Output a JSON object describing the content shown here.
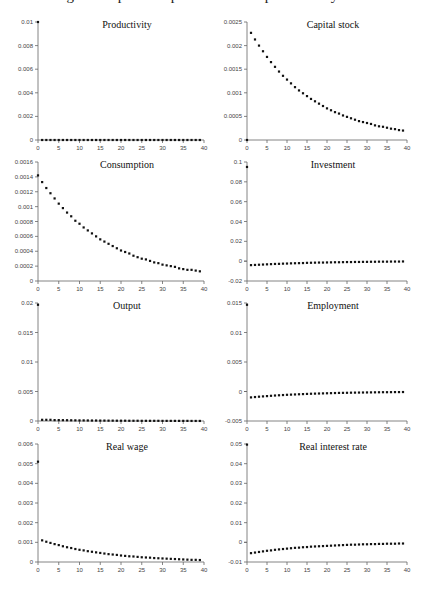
{
  "figure": {
    "title": "Figure: Impulse responses to a 1% productivity shock"
  },
  "chart_data": [
    {
      "type": "scatter",
      "title": "Productivity",
      "xlabel": "",
      "ylabel": "",
      "xlim": [
        0,
        40
      ],
      "ylim": [
        0,
        0.01
      ],
      "xticks": [
        "0",
        "5",
        "10",
        "15",
        "20",
        "25",
        "30",
        "35",
        "40"
      ],
      "yticks": [
        0,
        0.002,
        0.004,
        0.006,
        0.008,
        0.01
      ],
      "ytick_labels": [
        "0",
        "0.002",
        "0.004",
        "0.006",
        "0.008",
        "0.01"
      ],
      "grid": false,
      "x": [
        0,
        1,
        2,
        3,
        4,
        5,
        6,
        7,
        8,
        9,
        10,
        11,
        12,
        13,
        14,
        15,
        16,
        17,
        18,
        19,
        20,
        21,
        22,
        23,
        24,
        25,
        26,
        27,
        28,
        29,
        30,
        31,
        32,
        33,
        34,
        35,
        36,
        37,
        38,
        39
      ],
      "y": [
        0.01,
        0,
        0,
        0,
        0,
        0,
        0,
        0,
        0,
        0,
        0,
        0,
        0,
        0,
        0,
        0,
        0,
        0,
        0,
        0,
        0,
        0,
        0,
        0,
        0,
        0,
        0,
        0,
        0,
        0,
        0,
        0,
        0,
        0,
        0,
        0,
        0,
        0,
        0,
        0
      ]
    },
    {
      "type": "scatter",
      "title": "Capital stock",
      "xlabel": "",
      "ylabel": "",
      "xlim": [
        0,
        40
      ],
      "ylim": [
        0,
        0.0025
      ],
      "xticks": [
        "0",
        "5",
        "10",
        "15",
        "20",
        "25",
        "30",
        "35",
        "40"
      ],
      "yticks": [
        0,
        0.0005,
        0.001,
        0.0015,
        0.002,
        0.0025
      ],
      "ytick_labels": [
        "0",
        "0.0005",
        "0.001",
        "0.0015",
        "0.002",
        "0.0025"
      ],
      "grid": false,
      "x": [
        0,
        1,
        2,
        3,
        4,
        5,
        6,
        7,
        8,
        9,
        10,
        11,
        12,
        13,
        14,
        15,
        16,
        17,
        18,
        19,
        20,
        21,
        22,
        23,
        24,
        25,
        26,
        27,
        28,
        29,
        30,
        31,
        32,
        33,
        34,
        35,
        36,
        37,
        38,
        39
      ],
      "y": [
        0,
        0.00227,
        0.00213,
        0.002,
        0.00188,
        0.00176,
        0.00165,
        0.00155,
        0.00145,
        0.00136,
        0.00128,
        0.0012,
        0.00112,
        0.00105,
        0.00099,
        0.00093,
        0.00087,
        0.00082,
        0.00077,
        0.00072,
        0.00067,
        0.00063,
        0.00059,
        0.00056,
        0.00052,
        0.00049,
        0.00046,
        0.00043,
        0.0004,
        0.00038,
        0.00036,
        0.00034,
        0.00031,
        0.00029,
        0.00028,
        0.00026,
        0.00024,
        0.00023,
        0.00021,
        0.0002
      ]
    },
    {
      "type": "scatter",
      "title": "Consumption",
      "xlabel": "",
      "ylabel": "",
      "xlim": [
        0,
        40
      ],
      "ylim": [
        0,
        0.0016
      ],
      "xticks": [
        "0",
        "5",
        "10",
        "15",
        "20",
        "25",
        "30",
        "35",
        "40"
      ],
      "yticks": [
        0,
        0.0002,
        0.0004,
        0.0006,
        0.0008,
        0.001,
        0.0012,
        0.0014,
        0.0016
      ],
      "ytick_labels": [
        "0",
        "0.0002",
        "0.0004",
        "0.0006",
        "0.0008",
        "0.001",
        "0.0012",
        "0.0014",
        "0.0016"
      ],
      "grid": false,
      "x": [
        0,
        1,
        2,
        3,
        4,
        5,
        6,
        7,
        8,
        9,
        10,
        11,
        12,
        13,
        14,
        15,
        16,
        17,
        18,
        19,
        20,
        21,
        22,
        23,
        24,
        25,
        26,
        27,
        28,
        29,
        30,
        31,
        32,
        33,
        34,
        35,
        36,
        37,
        38,
        39
      ],
      "y": [
        0.00142,
        0.00133,
        0.00125,
        0.00118,
        0.00111,
        0.00104,
        0.00098,
        0.00092,
        0.00087,
        0.00081,
        0.00077,
        0.00072,
        0.00068,
        0.00064,
        0.0006,
        0.00056,
        0.00053,
        0.0005,
        0.00047,
        0.00044,
        0.00041,
        0.00039,
        0.00037,
        0.00034,
        0.00032,
        0.0003,
        0.00029,
        0.00027,
        0.00025,
        0.00024,
        0.00022,
        0.00021,
        0.0002,
        0.00019,
        0.00017,
        0.00016,
        0.00015,
        0.00015,
        0.00014,
        0.00013
      ]
    },
    {
      "type": "scatter",
      "title": "Investment",
      "xlabel": "",
      "ylabel": "",
      "xlim": [
        0,
        40
      ],
      "ylim": [
        -0.02,
        0.1
      ],
      "xticks": [
        "0",
        "5",
        "10",
        "15",
        "20",
        "25",
        "30",
        "35",
        "40"
      ],
      "yticks": [
        -0.02,
        0,
        0.02,
        0.04,
        0.06,
        0.08,
        0.1
      ],
      "ytick_labels": [
        "-0.02",
        "0",
        "0.02",
        "0.04",
        "0.06",
        "0.08",
        "0.1"
      ],
      "grid": false,
      "x": [
        0,
        1,
        2,
        3,
        4,
        5,
        6,
        7,
        8,
        9,
        10,
        11,
        12,
        13,
        14,
        15,
        16,
        17,
        18,
        19,
        20,
        21,
        22,
        23,
        24,
        25,
        26,
        27,
        28,
        29,
        30,
        31,
        32,
        33,
        34,
        35,
        36,
        37,
        38,
        39
      ],
      "y": [
        0.095,
        -0.004,
        -0.0038,
        -0.0036,
        -0.0034,
        -0.0032,
        -0.003,
        -0.0028,
        -0.0027,
        -0.0025,
        -0.0024,
        -0.0022,
        -0.0021,
        -0.002,
        -0.0019,
        -0.0017,
        -0.0016,
        -0.0015,
        -0.0014,
        -0.0014,
        -0.0013,
        -0.0012,
        -0.0011,
        -0.0011,
        -0.001,
        -0.0009,
        -0.0009,
        -0.0008,
        -0.0008,
        -0.0007,
        -0.0007,
        -0.0006,
        -0.0006,
        -0.0005,
        -0.0005,
        -0.0005,
        -0.0004,
        -0.0004,
        -0.0004,
        -0.0003
      ]
    },
    {
      "type": "scatter",
      "title": "Output",
      "xlabel": "",
      "ylabel": "",
      "xlim": [
        0,
        40
      ],
      "ylim": [
        0,
        0.02
      ],
      "xticks": [
        "0",
        "5",
        "10",
        "15",
        "20",
        "25",
        "30",
        "35",
        "40"
      ],
      "yticks": [
        0,
        0.005,
        0.01,
        0.015,
        0.02
      ],
      "ytick_labels": [
        "0",
        "0.005",
        "0.01",
        "0.015",
        "0.02"
      ],
      "grid": false,
      "x": [
        0,
        1,
        2,
        3,
        4,
        5,
        6,
        7,
        8,
        9,
        10,
        11,
        12,
        13,
        14,
        15,
        16,
        17,
        18,
        19,
        20,
        21,
        22,
        23,
        24,
        25,
        26,
        27,
        28,
        29,
        30,
        31,
        32,
        33,
        34,
        35,
        36,
        37,
        38,
        39
      ],
      "y": [
        0.0197,
        0.0002,
        0.0002,
        0.0002,
        0.00015,
        0.00015,
        0.00014,
        0.00013,
        0.00012,
        0.00011,
        0.0001,
        0.0001,
        9e-05,
        8e-05,
        8e-05,
        7e-05,
        7e-05,
        6e-05,
        6e-05,
        5e-05,
        5e-05,
        5e-05,
        4e-05,
        4e-05,
        4e-05,
        3e-05,
        3e-05,
        3e-05,
        3e-05,
        3e-05,
        2e-05,
        2e-05,
        2e-05,
        2e-05,
        2e-05,
        2e-05,
        2e-05,
        1e-05,
        1e-05,
        1e-05
      ]
    },
    {
      "type": "scatter",
      "title": "Employment",
      "xlabel": "",
      "ylabel": "",
      "xlim": [
        0,
        40
      ],
      "ylim": [
        -0.005,
        0.015
      ],
      "xticks": [
        "0",
        "5",
        "10",
        "15",
        "20",
        "25",
        "30",
        "35",
        "40"
      ],
      "yticks": [
        -0.005,
        0,
        0.005,
        0.01,
        0.015
      ],
      "ytick_labels": [
        "-0.005",
        "0",
        "0.005",
        "0.01",
        "0.015"
      ],
      "grid": false,
      "x": [
        0,
        1,
        2,
        3,
        4,
        5,
        6,
        7,
        8,
        9,
        10,
        11,
        12,
        13,
        14,
        15,
        16,
        17,
        18,
        19,
        20,
        21,
        22,
        23,
        24,
        25,
        26,
        27,
        28,
        29,
        30,
        31,
        32,
        33,
        34,
        35,
        36,
        37,
        38,
        39
      ],
      "y": [
        0.0147,
        -0.001,
        -0.00094,
        -0.00088,
        -0.00083,
        -0.00078,
        -0.00073,
        -0.00068,
        -0.00064,
        -0.0006,
        -0.00056,
        -0.00053,
        -0.0005,
        -0.00047,
        -0.00044,
        -0.00041,
        -0.00038,
        -0.00036,
        -0.00034,
        -0.00032,
        -0.0003,
        -0.00028,
        -0.00026,
        -0.00024,
        -0.00023,
        -0.00022,
        -0.0002,
        -0.00019,
        -0.00018,
        -0.00017,
        -0.00016,
        -0.00015,
        -0.00014,
        -0.00013,
        -0.00012,
        -0.00012,
        -0.00011,
        -0.0001,
        -0.0001,
        -9e-05
      ]
    },
    {
      "type": "scatter",
      "title": "Real wage",
      "xlabel": "",
      "ylabel": "",
      "xlim": [
        0,
        40
      ],
      "ylim": [
        0,
        0.006
      ],
      "xticks": [
        "0",
        "5",
        "10",
        "15",
        "20",
        "25",
        "30",
        "35",
        "40"
      ],
      "yticks": [
        0,
        0.001,
        0.002,
        0.003,
        0.004,
        0.005,
        0.006
      ],
      "ytick_labels": [
        "0",
        "0.001",
        "0.002",
        "0.003",
        "0.004",
        "0.005",
        "0.006"
      ],
      "grid": false,
      "x": [
        0,
        1,
        2,
        3,
        4,
        5,
        6,
        7,
        8,
        9,
        10,
        11,
        12,
        13,
        14,
        15,
        16,
        17,
        18,
        19,
        20,
        21,
        22,
        23,
        24,
        25,
        26,
        27,
        28,
        29,
        30,
        31,
        32,
        33,
        34,
        35,
        36,
        37,
        38,
        39
      ],
      "y": [
        0.0051,
        0.0011,
        0.00103,
        0.00097,
        0.00091,
        0.00086,
        0.0008,
        0.00075,
        0.00071,
        0.00066,
        0.00062,
        0.00059,
        0.00055,
        0.00052,
        0.00049,
        0.00046,
        0.00043,
        0.0004,
        0.00038,
        0.00036,
        0.00033,
        0.00031,
        0.00029,
        0.00028,
        0.00026,
        0.00024,
        0.00023,
        0.00022,
        0.0002,
        0.00019,
        0.00018,
        0.00017,
        0.00016,
        0.00015,
        0.00014,
        0.00013,
        0.00012,
        0.00011,
        0.00011,
        0.0001
      ]
    },
    {
      "type": "scatter",
      "title": "Real interest rate",
      "xlabel": "",
      "ylabel": "",
      "xlim": [
        0,
        40
      ],
      "ylim": [
        -0.01,
        0.05
      ],
      "xticks": [
        "0",
        "5",
        "10",
        "15",
        "20",
        "25",
        "30",
        "35",
        "40"
      ],
      "yticks": [
        -0.01,
        0,
        0.01,
        0.02,
        0.03,
        0.04,
        0.05
      ],
      "ytick_labels": [
        "-0.01",
        "0",
        "0.01",
        "0.02",
        "0.03",
        "0.04",
        "0.05"
      ],
      "grid": false,
      "x": [
        0,
        1,
        2,
        3,
        4,
        5,
        6,
        7,
        8,
        9,
        10,
        11,
        12,
        13,
        14,
        15,
        16,
        17,
        18,
        19,
        20,
        21,
        22,
        23,
        24,
        25,
        26,
        27,
        28,
        29,
        30,
        31,
        32,
        33,
        34,
        35,
        36,
        37,
        38,
        39
      ],
      "y": [
        0.0497,
        -0.0055,
        -0.0052,
        -0.0049,
        -0.0046,
        -0.0043,
        -0.0041,
        -0.0038,
        -0.0036,
        -0.0034,
        -0.0032,
        -0.003,
        -0.0028,
        -0.0027,
        -0.0025,
        -0.0024,
        -0.0022,
        -0.0021,
        -0.002,
        -0.0019,
        -0.0018,
        -0.0017,
        -0.0016,
        -0.0015,
        -0.0014,
        -0.0013,
        -0.0012,
        -0.0012,
        -0.0011,
        -0.001,
        -0.001,
        -0.0009,
        -0.0009,
        -0.0008,
        -0.0008,
        -0.0007,
        -0.0007,
        -0.0007,
        -0.0006,
        -0.0006
      ]
    }
  ]
}
